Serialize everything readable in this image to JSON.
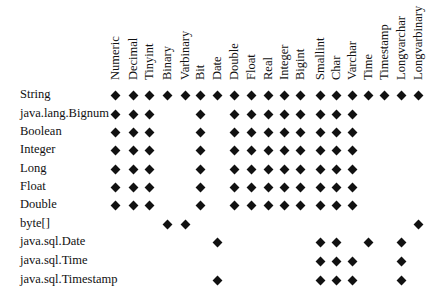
{
  "table": {
    "columns": [
      {
        "label": "Numeric",
        "x": 115
      },
      {
        "label": "Decimal",
        "x": 133
      },
      {
        "label": "Tinyint",
        "x": 149
      },
      {
        "label": "Binary",
        "x": 167
      },
      {
        "label": "Varbinary",
        "x": 185
      },
      {
        "label": "Bit",
        "x": 200
      },
      {
        "label": "Date",
        "x": 217
      },
      {
        "label": "Double",
        "x": 234
      },
      {
        "label": "Float",
        "x": 251
      },
      {
        "label": "Real",
        "x": 268
      },
      {
        "label": "Integer",
        "x": 284
      },
      {
        "label": "Bigint",
        "x": 300
      },
      {
        "label": "Smallint",
        "x": 320
      },
      {
        "label": "Char",
        "x": 336
      },
      {
        "label": "Varchar",
        "x": 352
      },
      {
        "label": "Time",
        "x": 368
      },
      {
        "label": "Timestamp",
        "x": 384
      },
      {
        "label": "Longvarchar",
        "x": 401
      },
      {
        "label": "Longvarbinary",
        "x": 418
      }
    ],
    "rows": [
      {
        "label": "String",
        "y": 95,
        "marks": [
          "Numeric",
          "Decimal",
          "Tinyint",
          "Binary",
          "Varbinary",
          "Bit",
          "Date",
          "Double",
          "Float",
          "Real",
          "Integer",
          "Bigint",
          "Smallint",
          "Char",
          "Varchar",
          "Time",
          "Timestamp",
          "Longvarchar",
          "Longvarbinary"
        ]
      },
      {
        "label": "java.lang.Bignum",
        "y": 114,
        "marks": [
          "Numeric",
          "Decimal",
          "Tinyint",
          "Bit",
          "Double",
          "Float",
          "Real",
          "Integer",
          "Bigint",
          "Smallint",
          "Char",
          "Varchar"
        ]
      },
      {
        "label": "Boolean",
        "y": 132,
        "marks": [
          "Numeric",
          "Decimal",
          "Tinyint",
          "Bit",
          "Double",
          "Float",
          "Real",
          "Integer",
          "Bigint",
          "Smallint",
          "Char",
          "Varchar"
        ]
      },
      {
        "label": "Integer",
        "y": 150,
        "marks": [
          "Numeric",
          "Decimal",
          "Tinyint",
          "Bit",
          "Double",
          "Float",
          "Real",
          "Integer",
          "Bigint",
          "Smallint",
          "Char",
          "Varchar"
        ]
      },
      {
        "label": "Long",
        "y": 169,
        "marks": [
          "Numeric",
          "Decimal",
          "Tinyint",
          "Bit",
          "Double",
          "Float",
          "Real",
          "Integer",
          "Bigint",
          "Smallint",
          "Char",
          "Varchar"
        ]
      },
      {
        "label": "Float",
        "y": 187,
        "marks": [
          "Numeric",
          "Decimal",
          "Tinyint",
          "Bit",
          "Double",
          "Float",
          "Real",
          "Integer",
          "Bigint",
          "Smallint",
          "Char",
          "Varchar"
        ]
      },
      {
        "label": "Double",
        "y": 205,
        "marks": [
          "Numeric",
          "Decimal",
          "Tinyint",
          "Bit",
          "Double",
          "Float",
          "Real",
          "Integer",
          "Bigint",
          "Smallint",
          "Char",
          "Varchar"
        ]
      },
      {
        "label": "byte[]",
        "y": 224,
        "marks": [
          "Binary",
          "Varbinary",
          "Longvarbinary"
        ]
      },
      {
        "label": "java.sql.Date",
        "y": 242,
        "marks": [
          "Date",
          "Smallint",
          "Char",
          "Time",
          "Longvarchar"
        ]
      },
      {
        "label": "java.sql.Time",
        "y": 261,
        "marks": [
          "Smallint",
          "Char",
          "Varchar",
          "Longvarchar"
        ]
      },
      {
        "label": "java.sql.Timestamp",
        "y": 280,
        "marks": [
          "Date",
          "Smallint",
          "Char",
          "Varchar",
          "Longvarchar"
        ]
      }
    ],
    "mark_symbol": "diamond-icon",
    "mark_color": "#111111"
  }
}
